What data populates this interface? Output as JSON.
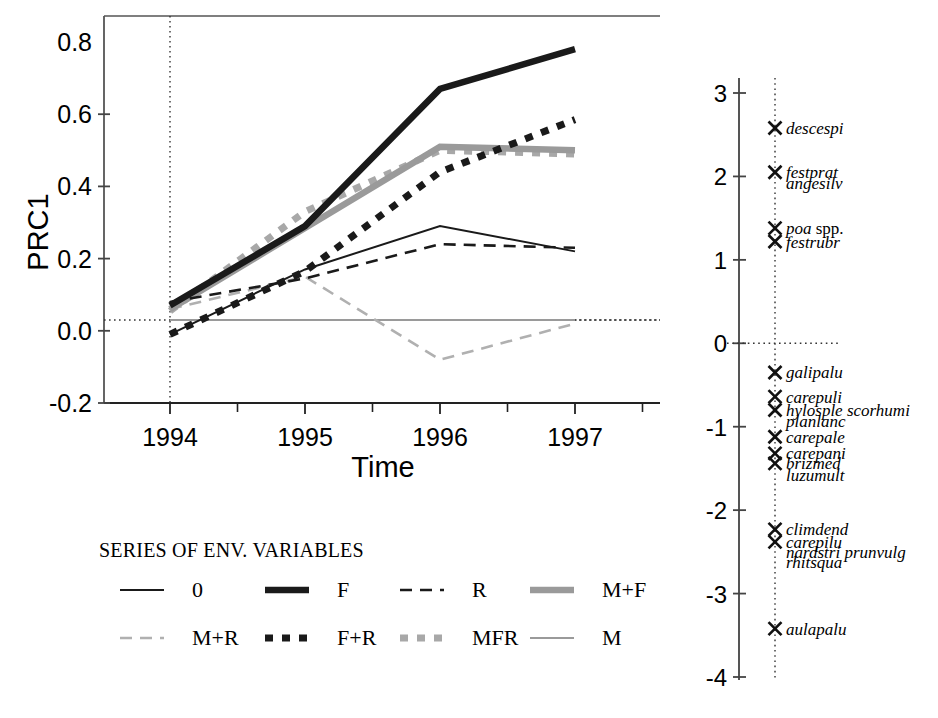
{
  "figure": {
    "title": "",
    "background": "#ffffff"
  },
  "chart_data": {
    "type": "line",
    "title": "",
    "xlabel": "Time",
    "ylabel": "PRC1",
    "x": [
      "1994",
      "1995",
      "1996",
      "1997"
    ],
    "xtick_labels": [
      "1994",
      "1995",
      "1996",
      "1997"
    ],
    "ytick_labels": [
      "0.8",
      "0.6",
      "0.4",
      "0.2",
      "0.0",
      "-0.2"
    ],
    "ylim": [
      -0.2,
      0.85
    ],
    "grid": false,
    "reference_line_y": 0.03,
    "legend_position": "below-left",
    "legend_title": "SERIES OF ENV. VARIABLES",
    "series": [
      {
        "name": "0",
        "style": "solid-thin",
        "color": "#1a1a1a",
        "values": [
          -0.01,
          0.17,
          0.29,
          0.22
        ]
      },
      {
        "name": "F",
        "style": "solid-thick",
        "color": "#1a1a1a",
        "values": [
          0.07,
          0.29,
          0.67,
          0.78
        ]
      },
      {
        "name": "R",
        "style": "dashed-thin",
        "color": "#1a1a1a",
        "values": [
          0.08,
          0.145,
          0.24,
          0.23
        ]
      },
      {
        "name": "M+F",
        "style": "solid-thick",
        "color": "#9a9a9a",
        "values": [
          0.06,
          0.285,
          0.51,
          0.5
        ]
      },
      {
        "name": "M+R",
        "style": "dashed-thin",
        "color": "#b0b0b0",
        "values": [
          0.06,
          0.15,
          -0.08,
          0.02
        ]
      },
      {
        "name": "F+R",
        "style": "dotted-thick",
        "color": "#1a1a1a",
        "values": [
          -0.01,
          0.165,
          0.44,
          0.585
        ]
      },
      {
        "name": "MFR",
        "style": "dotted-thick",
        "color": "#a8a8a8",
        "values": [
          0.055,
          0.33,
          0.5,
          0.49
        ]
      },
      {
        "name": "M",
        "style": "solid-thin",
        "color": "#9a9a9a",
        "values": [
          0.03,
          0.03,
          0.03,
          0.03
        ]
      }
    ]
  },
  "species_axis": {
    "label": "",
    "tick_labels": [
      "3",
      "2",
      "1",
      "0",
      "-1",
      "-2",
      "-3",
      "-4"
    ],
    "tick_values": [
      3,
      2,
      1,
      0,
      -1,
      -2,
      -3,
      -4
    ],
    "lim": [
      -4,
      3.3
    ],
    "reference_line_value": 0,
    "species": [
      {
        "name": "descespi",
        "value": 2.58,
        "marker": true,
        "roman_tail": ""
      },
      {
        "name": "festprat",
        "value": 2.05,
        "marker": true,
        "roman_tail": ""
      },
      {
        "name": "angesilv",
        "value": 1.92,
        "marker": false,
        "roman_tail": ""
      },
      {
        "name": "poa",
        "value": 1.38,
        "marker": true,
        "roman_tail": " spp."
      },
      {
        "name": "festrubr",
        "value": 1.22,
        "marker": true,
        "roman_tail": ""
      },
      {
        "name": "galipalu",
        "value": -0.35,
        "marker": true,
        "roman_tail": ""
      },
      {
        "name": "carepuli",
        "value": -0.64,
        "marker": true,
        "roman_tail": ""
      },
      {
        "name": "hylosple scorhumi",
        "value": -0.8,
        "marker": true,
        "roman_tail": ""
      },
      {
        "name": "planlanc",
        "value": -0.93,
        "marker": false,
        "roman_tail": ""
      },
      {
        "name": "carepale",
        "value": -1.12,
        "marker": true,
        "roman_tail": ""
      },
      {
        "name": "carepani",
        "value": -1.32,
        "marker": true,
        "roman_tail": ""
      },
      {
        "name": "brizmed",
        "value": -1.44,
        "marker": true,
        "roman_tail": ""
      },
      {
        "name": "luzumult",
        "value": -1.58,
        "marker": false,
        "roman_tail": ""
      },
      {
        "name": "climdend",
        "value": -2.23,
        "marker": true,
        "roman_tail": ""
      },
      {
        "name": "carepilu",
        "value": -2.38,
        "marker": true,
        "roman_tail": ""
      },
      {
        "name": "nardstri prunvulg",
        "value": -2.5,
        "marker": false,
        "roman_tail": ""
      },
      {
        "name": "rhitsqua",
        "value": -2.62,
        "marker": false,
        "roman_tail": ""
      },
      {
        "name": "aulapalu",
        "value": -3.42,
        "marker": true,
        "roman_tail": ""
      }
    ]
  },
  "legend": {
    "title": "SERIES OF ENV. VARIABLES",
    "rows": [
      [
        {
          "label": "0",
          "style": "solid-thin",
          "color": "#1a1a1a"
        },
        {
          "label": "F",
          "style": "solid-thick",
          "color": "#1a1a1a"
        },
        {
          "label": "R",
          "style": "dashed-thin",
          "color": "#1a1a1a"
        },
        {
          "label": "M+F",
          "style": "solid-thick",
          "color": "#9a9a9a"
        }
      ],
      [
        {
          "label": "M+R",
          "style": "dashed-thin",
          "color": "#b0b0b0"
        },
        {
          "label": "F+R",
          "style": "dotted-thick",
          "color": "#1a1a1a"
        },
        {
          "label": "MFR",
          "style": "dotted-thick",
          "color": "#a8a8a8"
        },
        {
          "label": "M",
          "style": "solid-thin",
          "color": "#9a9a9a"
        }
      ]
    ]
  },
  "colors": {
    "black": "#1a1a1a",
    "grey_mid": "#9a9a9a",
    "grey_light": "#b0b0b0",
    "axis": "#444444"
  }
}
